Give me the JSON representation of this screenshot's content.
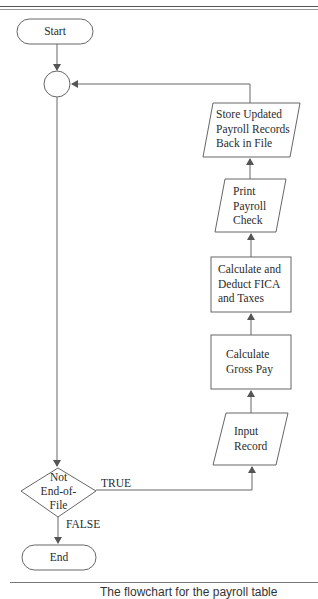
{
  "diagram": {
    "type": "flowchart",
    "nodes": {
      "start": {
        "shape": "terminal",
        "label": "Start"
      },
      "connector": {
        "shape": "circle",
        "label": ""
      },
      "decision": {
        "shape": "diamond",
        "lines": [
          "Not",
          "End-of-",
          "File"
        ]
      },
      "input": {
        "shape": "parallelogram",
        "lines": [
          "Input",
          "Record"
        ]
      },
      "gross": {
        "shape": "process",
        "lines": [
          "Calculate",
          "Gross Pay"
        ]
      },
      "fica": {
        "shape": "process",
        "lines": [
          "Calculate and",
          "Deduct FICA",
          "and Taxes"
        ]
      },
      "print": {
        "shape": "parallelogram",
        "lines": [
          "Print",
          "Payroll",
          "Check"
        ]
      },
      "store": {
        "shape": "parallelogram",
        "lines": [
          "Store Updated",
          "Payroll Records",
          "Back in File"
        ]
      },
      "end": {
        "shape": "terminal",
        "label": "End"
      }
    },
    "edges": [
      {
        "from": "start",
        "to": "connector"
      },
      {
        "from": "connector",
        "to": "decision"
      },
      {
        "from": "decision",
        "to": "input",
        "label": "TRUE"
      },
      {
        "from": "decision",
        "to": "end",
        "label": "FALSE"
      },
      {
        "from": "input",
        "to": "gross"
      },
      {
        "from": "gross",
        "to": "fica"
      },
      {
        "from": "fica",
        "to": "print"
      },
      {
        "from": "print",
        "to": "store"
      },
      {
        "from": "store",
        "to": "connector"
      }
    ],
    "edge_labels": {
      "true": "TRUE",
      "false": "FALSE"
    }
  },
  "caption": "The flowchart for the payroll table"
}
